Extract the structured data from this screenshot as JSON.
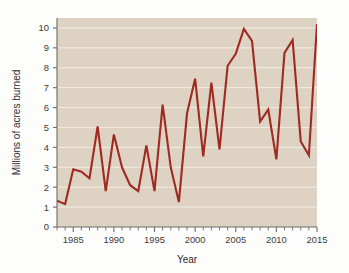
{
  "chart_data": {
    "type": "line",
    "title": "",
    "xlabel": "Year",
    "ylabel": "Millions of acres burned",
    "xlim": [
      1983,
      2015
    ],
    "ylim": [
      0,
      10.5
    ],
    "grid": true,
    "legend": false,
    "legend_position": "none",
    "line_color": "#9e2a21",
    "plot_background": "#ded2c3",
    "gridline_color": "#f2ece4",
    "x_tick_labels": [
      "1985",
      "1990",
      "1995",
      "2000",
      "2005",
      "2010",
      "2015"
    ],
    "x_tick_values": [
      1985,
      1990,
      1995,
      2000,
      2005,
      2010,
      2015
    ],
    "x_minor_tick_step": 1,
    "y_tick_labels": [
      "0",
      "1",
      "2",
      "3",
      "4",
      "5",
      "6",
      "7",
      "8",
      "9",
      "10"
    ],
    "y_tick_values": [
      0,
      1,
      2,
      3,
      4,
      5,
      6,
      7,
      8,
      9,
      10
    ],
    "x": [
      1983,
      1984,
      1985,
      1986,
      1987,
      1988,
      1989,
      1990,
      1991,
      1992,
      1993,
      1994,
      1995,
      1996,
      1997,
      1998,
      1999,
      2000,
      2001,
      2002,
      2003,
      2004,
      2005,
      2006,
      2007,
      2008,
      2009,
      2010,
      2011,
      2012,
      2013,
      2014,
      2015
    ],
    "values": [
      1.32,
      1.15,
      2.9,
      2.78,
      2.45,
      5.05,
      1.8,
      4.65,
      3.0,
      2.1,
      1.8,
      4.1,
      1.8,
      6.15,
      3.0,
      1.25,
      5.7,
      7.45,
      3.55,
      7.25,
      3.9,
      8.1,
      8.7,
      9.95,
      9.35,
      5.3,
      5.9,
      3.4,
      8.75,
      9.4,
      4.3,
      3.6,
      10.2
    ],
    "series": [
      {
        "name": "Acres burned",
        "color": "#9e2a21",
        "values": [
          1.32,
          1.15,
          2.9,
          2.78,
          2.45,
          5.05,
          1.8,
          4.65,
          3.0,
          2.1,
          1.8,
          4.1,
          1.8,
          6.15,
          3.0,
          1.25,
          5.7,
          7.45,
          3.55,
          7.25,
          3.9,
          8.1,
          8.7,
          9.95,
          9.35,
          5.3,
          5.9,
          3.4,
          8.75,
          9.4,
          4.3,
          3.6,
          10.2
        ]
      }
    ],
    "annotations": []
  },
  "axes": {
    "y_title": "Millions of acres burned",
    "x_title": "Year"
  }
}
